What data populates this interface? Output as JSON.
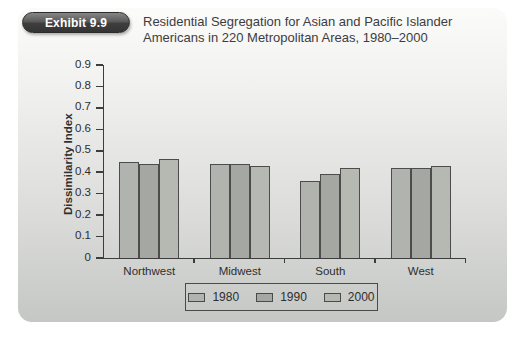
{
  "exhibit": {
    "badge": "Exhibit 9.9",
    "title_line1": "Residential Segregation for Asian and Pacific Islander",
    "title_line2": "Americans in 220 Metropolitan Areas, 1980–2000"
  },
  "chart_data": {
    "type": "bar",
    "title": "Residential Segregation for Asian and Pacific Islander Americans in 220 Metropolitan Areas, 1980–2000",
    "categories": [
      "Northwest",
      "Midwest",
      "South",
      "West"
    ],
    "series": [
      {
        "name": "1980",
        "color": "#b1b3ae",
        "values": [
          0.45,
          0.44,
          0.36,
          0.42
        ]
      },
      {
        "name": "1990",
        "color": "#a5a7a2",
        "values": [
          0.44,
          0.44,
          0.39,
          0.42
        ]
      },
      {
        "name": "2000",
        "color": "#b6b8b2",
        "values": [
          0.46,
          0.43,
          0.42,
          0.43
        ]
      }
    ],
    "xlabel": "",
    "ylabel": "Dissimilarity Index",
    "ylim": [
      0,
      0.9
    ],
    "ytick_labels": [
      "0.9",
      "0.8",
      "0.7",
      "0.6",
      "0.5",
      "0.4",
      "0.3",
      "0.2",
      "0.1",
      "0"
    ],
    "grid": false,
    "legend_position": "bottom",
    "bar_outline_color": "#4c4c4c",
    "axis_color": "#3d3d3d"
  }
}
